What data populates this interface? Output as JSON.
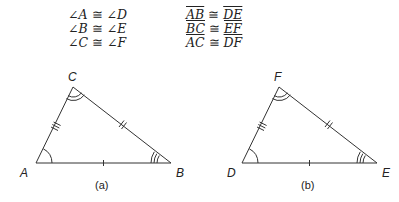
{
  "statements": {
    "angles": [
      {
        "left": "A",
        "right": "D"
      },
      {
        "left": "B",
        "right": "E"
      },
      {
        "left": "C",
        "right": "F"
      }
    ],
    "segments": [
      {
        "left": "AB",
        "right": "DE"
      },
      {
        "left": "BC",
        "right": "EF"
      },
      {
        "left": "AC",
        "right": "DF"
      }
    ],
    "angle_symbol": "∠",
    "congruent_symbol": "≅"
  },
  "triangles": [
    {
      "caption": "(a)",
      "vertices": {
        "v1": "A",
        "v2": "B",
        "v3": "C"
      },
      "points": {
        "v1": [
          36,
          163
        ],
        "v2": [
          171,
          163
        ],
        "v3": [
          73,
          87
        ]
      }
    },
    {
      "caption": "(b)",
      "vertices": {
        "v1": "D",
        "v2": "E",
        "v3": "F"
      },
      "points": {
        "v1": [
          242,
          163
        ],
        "v2": [
          377,
          163
        ],
        "v3": [
          279,
          87
        ]
      }
    }
  ],
  "colors": {
    "stroke": "#333333",
    "text": "#222222"
  }
}
